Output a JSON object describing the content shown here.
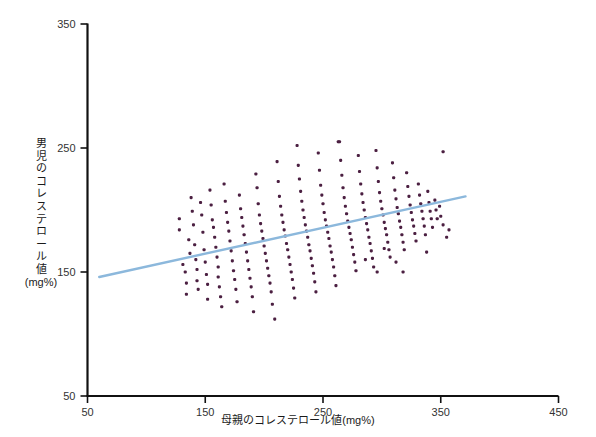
{
  "chart_data": {
    "type": "scatter",
    "title": "",
    "xlabel": "母親のコレステロール値(mg%)",
    "ylabel": "男児のコレステロール値(mg%)",
    "ylabel_chars": [
      "男",
      "児",
      "の",
      "コ",
      "レ",
      "ス",
      "テ",
      "ロ",
      "ー",
      "ル",
      "値"
    ],
    "ylabel_unit": "(mg%)",
    "xlim": [
      50,
      450
    ],
    "ylim": [
      50,
      350
    ],
    "xticks": [
      50,
      150,
      250,
      350,
      450
    ],
    "yticks": [
      50,
      150,
      250,
      350
    ],
    "xtick_labels": [
      "50",
      "150",
      "250",
      "350",
      "450"
    ],
    "ytick_labels": [
      "50",
      "150",
      "250",
      "350"
    ],
    "grid": false,
    "legend": "none",
    "point_color": "#4b1f41",
    "line_color": "#8cb8dc",
    "axis_color": "#111111",
    "point_size": 3.1,
    "trendline": {
      "type": "linear",
      "x_start": 60,
      "y_start": 146,
      "x_end": 371,
      "y_end": 211
    },
    "points": [
      [
        128,
        193
      ],
      [
        128,
        184
      ],
      [
        131,
        156
      ],
      [
        133,
        150
      ],
      [
        134,
        141
      ],
      [
        134,
        132
      ],
      [
        136,
        176
      ],
      [
        137,
        165
      ],
      [
        138,
        210
      ],
      [
        139,
        199
      ],
      [
        140,
        188
      ],
      [
        141,
        172
      ],
      [
        142,
        160
      ],
      [
        143,
        152
      ],
      [
        143,
        143
      ],
      [
        144,
        136
      ],
      [
        146,
        206
      ],
      [
        147,
        196
      ],
      [
        148,
        182
      ],
      [
        149,
        168
      ],
      [
        150,
        158
      ],
      [
        151,
        148
      ],
      [
        152,
        140
      ],
      [
        152,
        128
      ],
      [
        154,
        216
      ],
      [
        155,
        204
      ],
      [
        156,
        192
      ],
      [
        157,
        186
      ],
      [
        158,
        178
      ],
      [
        159,
        170
      ],
      [
        160,
        162
      ],
      [
        161,
        154
      ],
      [
        161,
        146
      ],
      [
        162,
        138
      ],
      [
        163,
        130
      ],
      [
        164,
        122
      ],
      [
        166,
        221
      ],
      [
        167,
        207
      ],
      [
        168,
        198
      ],
      [
        169,
        190
      ],
      [
        170,
        183
      ],
      [
        171,
        175
      ],
      [
        172,
        167
      ],
      [
        173,
        159
      ],
      [
        174,
        151
      ],
      [
        175,
        144
      ],
      [
        176,
        136
      ],
      [
        177,
        126
      ],
      [
        179,
        212
      ],
      [
        180,
        201
      ],
      [
        181,
        194
      ],
      [
        182,
        187
      ],
      [
        183,
        180
      ],
      [
        184,
        173
      ],
      [
        185,
        166
      ],
      [
        186,
        159
      ],
      [
        187,
        152
      ],
      [
        188,
        145
      ],
      [
        189,
        138
      ],
      [
        190,
        130
      ],
      [
        191,
        118
      ],
      [
        193,
        229
      ],
      [
        194,
        218
      ],
      [
        195,
        205
      ],
      [
        196,
        196
      ],
      [
        197,
        189
      ],
      [
        198,
        183
      ],
      [
        199,
        177
      ],
      [
        200,
        171
      ],
      [
        201,
        165
      ],
      [
        202,
        159
      ],
      [
        203,
        153
      ],
      [
        204,
        147
      ],
      [
        205,
        141
      ],
      [
        206,
        134
      ],
      [
        207,
        124
      ],
      [
        209,
        112
      ],
      [
        211,
        239
      ],
      [
        212,
        223
      ],
      [
        213,
        211
      ],
      [
        214,
        203
      ],
      [
        215,
        196
      ],
      [
        216,
        190
      ],
      [
        217,
        184
      ],
      [
        218,
        179
      ],
      [
        219,
        173
      ],
      [
        220,
        168
      ],
      [
        221,
        162
      ],
      [
        222,
        156
      ],
      [
        223,
        150
      ],
      [
        224,
        144
      ],
      [
        225,
        137
      ],
      [
        226,
        129
      ],
      [
        228,
        252
      ],
      [
        229,
        236
      ],
      [
        230,
        225
      ],
      [
        231,
        215
      ],
      [
        232,
        207
      ],
      [
        233,
        200
      ],
      [
        234,
        194
      ],
      [
        235,
        188
      ],
      [
        236,
        183
      ],
      [
        237,
        178
      ],
      [
        238,
        172
      ],
      [
        239,
        167
      ],
      [
        240,
        161
      ],
      [
        241,
        155
      ],
      [
        242,
        149
      ],
      [
        243,
        142
      ],
      [
        244,
        134
      ],
      [
        246,
        246
      ],
      [
        247,
        232
      ],
      [
        248,
        220
      ],
      [
        249,
        212
      ],
      [
        250,
        205
      ],
      [
        251,
        198
      ],
      [
        252,
        192
      ],
      [
        253,
        187
      ],
      [
        254,
        182
      ],
      [
        255,
        177
      ],
      [
        256,
        171
      ],
      [
        257,
        166
      ],
      [
        258,
        160
      ],
      [
        259,
        154
      ],
      [
        260,
        147
      ],
      [
        261,
        139
      ],
      [
        263,
        255
      ],
      [
        264,
        255
      ],
      [
        265,
        240
      ],
      [
        266,
        228
      ],
      [
        267,
        218
      ],
      [
        268,
        210
      ],
      [
        269,
        203
      ],
      [
        270,
        197
      ],
      [
        271,
        191
      ],
      [
        272,
        186
      ],
      [
        273,
        181
      ],
      [
        274,
        176
      ],
      [
        275,
        170
      ],
      [
        276,
        164
      ],
      [
        277,
        158
      ],
      [
        278,
        151
      ],
      [
        280,
        244
      ],
      [
        281,
        231
      ],
      [
        282,
        221
      ],
      [
        283,
        213
      ],
      [
        284,
        206
      ],
      [
        285,
        200
      ],
      [
        286,
        194
      ],
      [
        287,
        189
      ],
      [
        288,
        184
      ],
      [
        289,
        178
      ],
      [
        290,
        173
      ],
      [
        291,
        167
      ],
      [
        292,
        161
      ],
      [
        293,
        154
      ],
      [
        295,
        248
      ],
      [
        296,
        234
      ],
      [
        297,
        223
      ],
      [
        298,
        214
      ],
      [
        299,
        207
      ],
      [
        300,
        201
      ],
      [
        301,
        196
      ],
      [
        302,
        190
      ],
      [
        303,
        185
      ],
      [
        304,
        180
      ],
      [
        305,
        174
      ],
      [
        306,
        168
      ],
      [
        307,
        162
      ],
      [
        309,
        238
      ],
      [
        310,
        226
      ],
      [
        311,
        216
      ],
      [
        312,
        209
      ],
      [
        313,
        202
      ],
      [
        314,
        197
      ],
      [
        315,
        191
      ],
      [
        316,
        186
      ],
      [
        317,
        180
      ],
      [
        318,
        174
      ],
      [
        319,
        168
      ],
      [
        321,
        230
      ],
      [
        322,
        219
      ],
      [
        323,
        211
      ],
      [
        324,
        204
      ],
      [
        325,
        198
      ],
      [
        326,
        192
      ],
      [
        327,
        187
      ],
      [
        328,
        181
      ],
      [
        329,
        175
      ],
      [
        331,
        221
      ],
      [
        332,
        212
      ],
      [
        333,
        205
      ],
      [
        334,
        199
      ],
      [
        335,
        193
      ],
      [
        336,
        187
      ],
      [
        337,
        180
      ],
      [
        339,
        215
      ],
      [
        340,
        206
      ],
      [
        341,
        199
      ],
      [
        342,
        193
      ],
      [
        343,
        186
      ],
      [
        345,
        208
      ],
      [
        346,
        200
      ],
      [
        347,
        193
      ],
      [
        349,
        203
      ],
      [
        350,
        195
      ],
      [
        352,
        188
      ],
      [
        357,
        184
      ],
      [
        296,
        150
      ],
      [
        318,
        150
      ],
      [
        352,
        247
      ],
      [
        355,
        178
      ],
      [
        302,
        169
      ],
      [
        338,
        166
      ],
      [
        286,
        160
      ],
      [
        312,
        158
      ]
    ]
  }
}
